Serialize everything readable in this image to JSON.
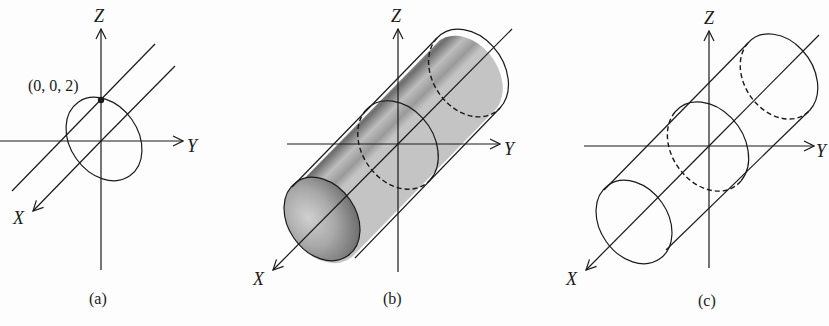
{
  "figure": {
    "panels": [
      {
        "caption": "(a)",
        "axes": {
          "x": "X",
          "y": "Y",
          "z": "Z"
        },
        "point_label": "(0, 0, 2)",
        "description": "Circle in the YZ-plane of radius 2 centered at origin, with line through (0,0,2) parallel to X-axis"
      },
      {
        "caption": "(b)",
        "axes": {
          "x": "X",
          "y": "Y",
          "z": "Z"
        },
        "description": "Shaded circular cylinder with axis along X-axis"
      },
      {
        "caption": "(c)",
        "axes": {
          "x": "X",
          "y": "Y",
          "z": "Z"
        },
        "description": "Wireframe circular cylinder with axis along X-axis"
      }
    ],
    "colors": {
      "ink": "#1a1a1a",
      "background": "#fdfdfd",
      "shade_dark": "#5a5a5a",
      "shade_light": "#d8d8d8"
    }
  }
}
